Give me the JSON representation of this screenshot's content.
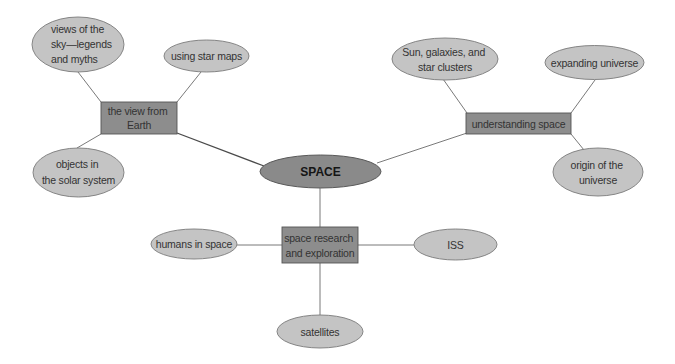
{
  "diagram": {
    "type": "concept-map",
    "colors": {
      "leaf_fill": "#c4c4c4",
      "hub_fill": "#8d8d8d",
      "center_fill": "#8a8a8a",
      "line": "#6a6a6a"
    },
    "center": {
      "label": "SPACE"
    },
    "hubs": [
      {
        "id": "view-from-earth",
        "label_lines": [
          "the view from",
          "Earth"
        ],
        "children": [
          {
            "id": "views-of-the-sky",
            "label_lines": [
              "views of the",
              "sky—legends",
              "and myths"
            ]
          },
          {
            "id": "using-star-maps",
            "label_lines": [
              "using star maps"
            ]
          },
          {
            "id": "objects-in-solar-system",
            "label_lines": [
              "objects in",
              "the solar system"
            ]
          }
        ]
      },
      {
        "id": "understanding-space",
        "label_lines": [
          "understanding space"
        ],
        "children": [
          {
            "id": "sun-galaxies-star-clusters",
            "label_lines": [
              "Sun, galaxies, and",
              "star clusters"
            ]
          },
          {
            "id": "expanding-universe",
            "label_lines": [
              "expanding universe"
            ]
          },
          {
            "id": "origin-of-universe",
            "label_lines": [
              "origin of the",
              "universe"
            ]
          }
        ]
      },
      {
        "id": "space-research-exploration",
        "label_lines": [
          "space research",
          "and exploration"
        ],
        "children": [
          {
            "id": "humans-in-space",
            "label_lines": [
              "humans in space"
            ]
          },
          {
            "id": "iss",
            "label_lines": [
              "ISS"
            ]
          },
          {
            "id": "satellites",
            "label_lines": [
              "satellites"
            ]
          }
        ]
      }
    ]
  }
}
